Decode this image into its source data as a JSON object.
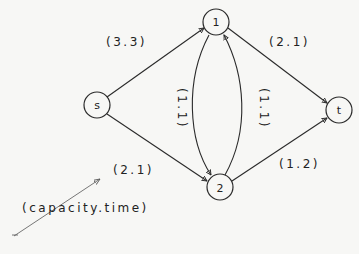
{
  "diagram": {
    "type": "flow-network",
    "nodes": [
      {
        "id": "s",
        "label": "s",
        "x": 97,
        "y": 105
      },
      {
        "id": "1",
        "label": "1",
        "x": 216,
        "y": 22
      },
      {
        "id": "2",
        "label": "2",
        "x": 220,
        "y": 187
      },
      {
        "id": "t",
        "label": "t",
        "x": 339,
        "y": 110
      }
    ],
    "edges": [
      {
        "from": "s",
        "to": "1",
        "label": "(3,3)"
      },
      {
        "from": "s",
        "to": "2",
        "label": "(2,1)"
      },
      {
        "from": "1",
        "to": "t",
        "label": "(2,1)"
      },
      {
        "from": "2",
        "to": "t",
        "label": "(1,2)"
      },
      {
        "from": "1",
        "to": "2",
        "label": "(1,1)"
      },
      {
        "from": "2",
        "to": "1",
        "label": "(1,1)"
      }
    ],
    "legend": {
      "label": "(capacity, time)"
    }
  },
  "labels": {
    "node_s": "s",
    "node_1": "1",
    "node_2": "2",
    "node_t": "t",
    "edge_s_1": "(3.3)",
    "edge_1_t": "(2.1)",
    "edge_s_2": "(2.1)",
    "edge_2_t": "(1.2)",
    "edge_1_2": "(1.1)",
    "edge_2_1": "(1.1)",
    "legend": "(capacity.time)"
  }
}
